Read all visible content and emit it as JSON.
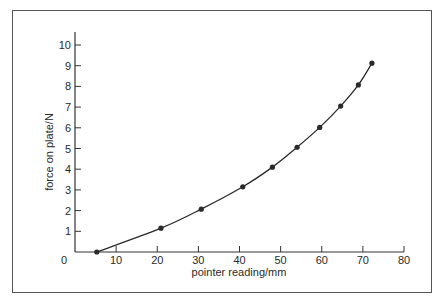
{
  "chart_data": {
    "type": "line",
    "title": "",
    "xlabel": "pointer reading/mm",
    "ylabel": "force on plate/N",
    "xlim": [
      0,
      80
    ],
    "ylim": [
      0,
      10
    ],
    "x_ticks": [
      0,
      10,
      20,
      30,
      40,
      50,
      60,
      70,
      80
    ],
    "x_tick_labels": [
      "0",
      "10",
      "20",
      "30",
      "40",
      "50",
      "60",
      "70",
      "80"
    ],
    "y_ticks": [
      1,
      2,
      3,
      4,
      5,
      6,
      7,
      8,
      9,
      10
    ],
    "y_tick_labels": [
      "1",
      "2",
      "3",
      "4",
      "5",
      "6",
      "7",
      "8",
      "9",
      "10"
    ],
    "grid": false,
    "legend": null,
    "series": [
      {
        "name": "force vs pointer reading",
        "marker": "circle",
        "smooth_curve": true,
        "color": "#2a2a2a",
        "x": [
          5.3,
          20.9,
          30.7,
          40.8,
          48.0,
          54.0,
          59.5,
          64.6,
          68.9,
          72.2
        ],
        "y": [
          0.0,
          1.15,
          2.07,
          3.15,
          4.1,
          5.06,
          6.02,
          7.05,
          8.07,
          9.12
        ]
      }
    ]
  }
}
